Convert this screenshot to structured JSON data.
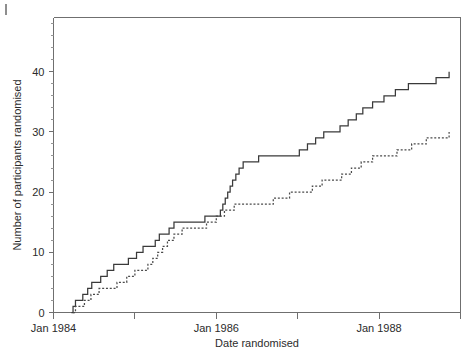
{
  "figure": {
    "corner_mark": "|",
    "background_color": "#ffffff",
    "axis_color": "#6f6f6f"
  },
  "chart_data": {
    "type": "line",
    "title": "",
    "subtitle": "",
    "xlabel": "Date randomised",
    "ylabel": "Number of participants randomised",
    "xlim": [
      1984.0,
      1989.0
    ],
    "ylim": [
      0,
      49
    ],
    "grid": false,
    "legend": "none",
    "x_tick_values": [
      1984.0,
      1985.0,
      1986.0,
      1987.0,
      1988.0,
      1989.0
    ],
    "x_tick_labels": [
      "Jan 1984",
      "",
      "Jan 1986",
      "",
      "Jan 1988",
      ""
    ],
    "y_major_ticks": [
      0,
      10,
      20,
      30,
      40
    ],
    "y_major_labels": [
      "0",
      "10",
      "20",
      "30",
      "40"
    ],
    "y_minor_ticks": [
      2,
      4,
      6,
      8,
      12,
      14,
      16,
      18,
      22,
      24,
      26,
      28,
      32,
      34,
      36,
      38,
      42,
      44,
      46,
      48
    ],
    "series": [
      {
        "name": "solid-step-curve",
        "style": "solid",
        "color": "#3a3a3a",
        "final_value": 40,
        "x": [
          1984.22,
          1984.24,
          1984.27,
          1984.3,
          1984.36,
          1984.42,
          1984.47,
          1984.52,
          1984.58,
          1984.66,
          1984.74,
          1984.82,
          1984.92,
          1985.02,
          1985.1,
          1985.18,
          1985.25,
          1985.3,
          1985.35,
          1985.42,
          1985.48,
          1985.54,
          1985.6,
          1985.66,
          1985.7,
          1985.76,
          1985.86,
          1986.0,
          1986.05,
          1986.08,
          1986.11,
          1986.14,
          1986.17,
          1986.2,
          1986.24,
          1986.28,
          1986.33,
          1986.4,
          1986.52,
          1986.7,
          1986.86,
          1987.02,
          1987.12,
          1987.22,
          1987.32,
          1987.42,
          1987.52,
          1987.62,
          1987.72,
          1987.8,
          1987.92,
          1988.06,
          1988.2,
          1988.36,
          1988.52,
          1988.7,
          1988.86
        ],
        "y": [
          0,
          1,
          2,
          2,
          3,
          4,
          5,
          5,
          6,
          7,
          8,
          8,
          9,
          10,
          11,
          11,
          12,
          13,
          13,
          14,
          15,
          15,
          15,
          15,
          15,
          15,
          16,
          16,
          17,
          18,
          19,
          20,
          21,
          22,
          23,
          24,
          25,
          25,
          26,
          26,
          26,
          27,
          28,
          29,
          30,
          30,
          31,
          32,
          33,
          34,
          35,
          36,
          37,
          38,
          38,
          39,
          40
        ]
      },
      {
        "name": "dotted-step-curve",
        "style": "dotted",
        "color": "#4a4a4a",
        "final_value": 30,
        "x": [
          1984.24,
          1984.27,
          1984.32,
          1984.38,
          1984.46,
          1984.56,
          1984.66,
          1984.78,
          1984.9,
          1985.0,
          1985.08,
          1985.16,
          1985.22,
          1985.28,
          1985.34,
          1985.4,
          1985.48,
          1985.58,
          1985.72,
          1985.88,
          1986.0,
          1986.1,
          1986.22,
          1986.34,
          1986.5,
          1986.7,
          1986.9,
          1987.05,
          1987.18,
          1987.3,
          1987.42,
          1987.54,
          1987.66,
          1987.78,
          1987.92,
          1988.06,
          1988.22,
          1988.4,
          1988.58,
          1988.72,
          1988.86
        ],
        "y": [
          0,
          1,
          1,
          2,
          3,
          4,
          4,
          5,
          6,
          7,
          7,
          8,
          9,
          10,
          11,
          12,
          13,
          14,
          14,
          15,
          16,
          17,
          18,
          18,
          18,
          19,
          20,
          20,
          21,
          22,
          22,
          23,
          24,
          25,
          26,
          26,
          27,
          28,
          29,
          29,
          30
        ]
      }
    ],
    "annotations": []
  }
}
